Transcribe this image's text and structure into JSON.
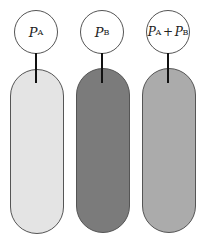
{
  "diagram": {
    "tubes": [
      {
        "label_symbol": "P",
        "label_sub": "A",
        "fill_color": "#e4e4e4"
      },
      {
        "label_symbol": "P",
        "label_sub": "B",
        "fill_color": "#7b7b7b"
      },
      {
        "label_symbol_1": "P",
        "label_sub_1": "A",
        "operator": "+",
        "label_symbol_2": "P",
        "label_sub_2": "B",
        "fill_color": "#ababab"
      }
    ]
  }
}
